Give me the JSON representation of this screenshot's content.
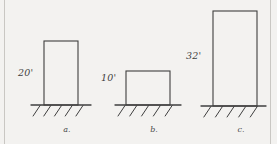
{
  "figure": {
    "background_color": "#f3f2f0",
    "stroke_color": "#3f3f3f",
    "rule_color": "#c9c7c3"
  },
  "items": [
    {
      "caption": "a.",
      "dimension_label": "20'",
      "height_feet": 20,
      "rect": {
        "x": 44,
        "y": 41,
        "w": 34,
        "h": 64
      },
      "ground": {
        "x1": 31,
        "x2": 91,
        "y": 105
      },
      "hatch_count": 5,
      "label_pos": {
        "x": 18,
        "y": 68
      },
      "caption_pos": {
        "x": 50,
        "y": 126
      }
    },
    {
      "caption": "b.",
      "dimension_label": "10'",
      "height_feet": 10,
      "rect": {
        "x": 126,
        "y": 71,
        "w": 44,
        "h": 34
      },
      "ground": {
        "x1": 115,
        "x2": 181,
        "y": 105
      },
      "hatch_count": 5,
      "label_pos": {
        "x": 101,
        "y": 73
      },
      "caption_pos": {
        "x": 132,
        "y": 126
      }
    },
    {
      "caption": "c.",
      "dimension_label": "32'",
      "height_feet": 32,
      "rect": {
        "x": 213,
        "y": 11,
        "w": 44,
        "h": 95
      },
      "ground": {
        "x1": 201,
        "x2": 266,
        "y": 106
      },
      "hatch_count": 5,
      "label_pos": {
        "x": 186,
        "y": 51
      },
      "caption_pos": {
        "x": 219,
        "y": 126
      }
    }
  ],
  "page_rules": [
    {
      "name": "left-margin-rule",
      "x": 4
    },
    {
      "name": "right-margin-rule",
      "x": 270
    }
  ]
}
